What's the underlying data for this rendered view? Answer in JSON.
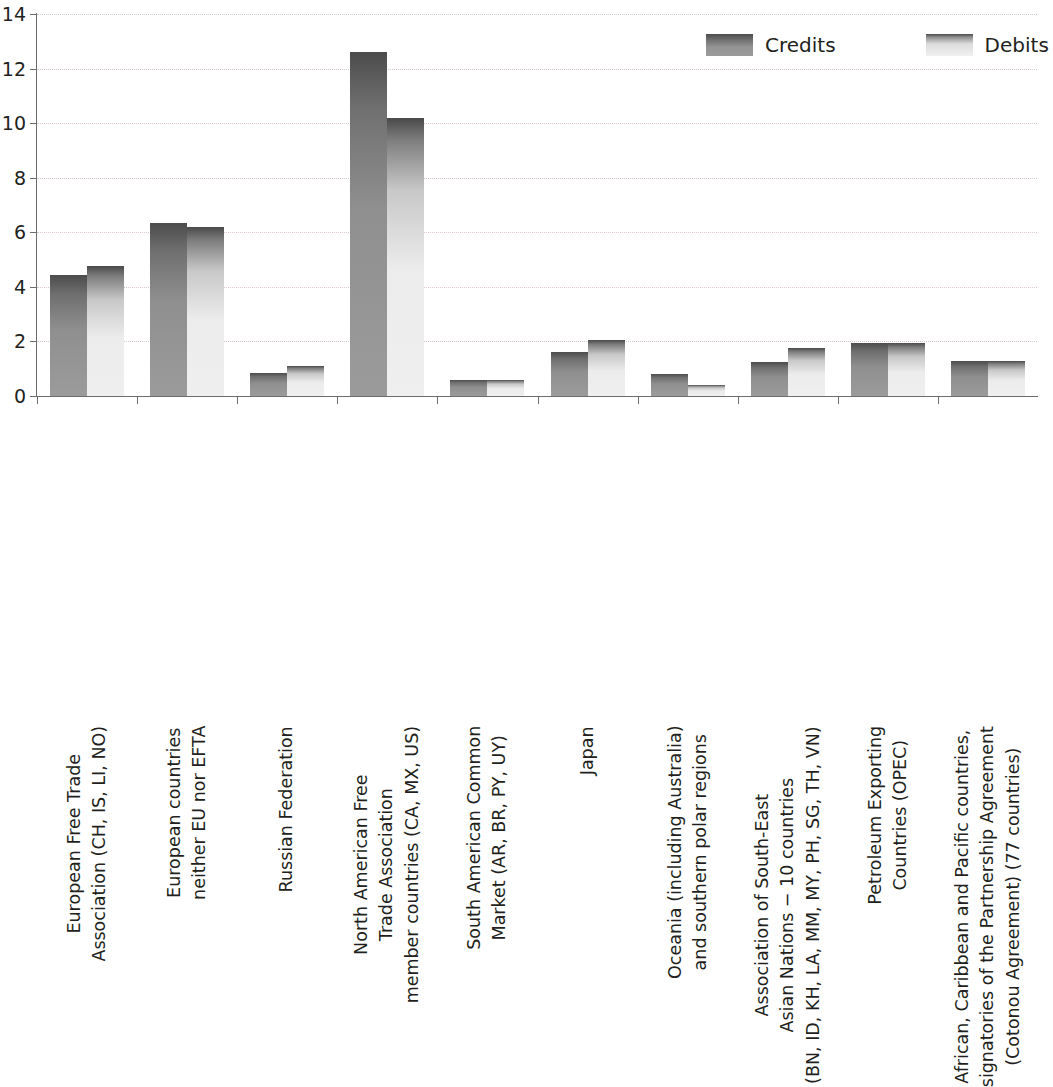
{
  "chart_data": {
    "type": "bar",
    "title": "",
    "subtitle": "",
    "xlabel": "",
    "ylabel": "",
    "ylim": [
      0,
      14
    ],
    "yticks": [
      0,
      2,
      4,
      6,
      8,
      10,
      12,
      14
    ],
    "ytick_labels": [
      "0",
      "2",
      "4",
      "6",
      "8",
      "10",
      "12",
      "14"
    ],
    "grid": true,
    "grid_axis": "y",
    "legend_position": "top-right",
    "categories": [
      "European Free Trade\nAssociation (CH, IS, LI, NO)",
      "European countries\nneither EU nor EFTA",
      "Russian Federation",
      "North American Free\nTrade Association\nmember countries (CA, MX, US)",
      "South American Common\nMarket (AR, BR, PY, UY)",
      "Japan",
      "Oceania (including Australia)\nand southern polar regions",
      "Association of South-East\nAsian Nations − 10 countries\n(BN, ID, KH, LA, MM, MY, PH, SG, TH, VN)",
      "Petroleum Exporting\nCountries (OPEC)",
      "African, Caribbean and Pacific countries,\nsignatories of the Partnership Agreement\n(Cotonou Agreement) (77 countries)"
    ],
    "series": [
      {
        "name": "Credits",
        "color": "#7b7b7b",
        "values": [
          4.45,
          6.35,
          0.85,
          12.6,
          0.6,
          1.6,
          0.8,
          1.25,
          1.95,
          1.3
        ]
      },
      {
        "name": "Debits",
        "color": "#ededed",
        "values": [
          4.75,
          6.2,
          1.1,
          10.2,
          0.6,
          2.05,
          0.4,
          1.75,
          1.95,
          1.3
        ]
      }
    ]
  },
  "legend": {
    "items": [
      {
        "label": "Credits",
        "swatch": "credits-swatch"
      },
      {
        "label": "Debits",
        "swatch": "debits-swatch"
      }
    ]
  },
  "axes": {
    "y": {
      "min": 0,
      "max": 14,
      "step": 2
    }
  }
}
